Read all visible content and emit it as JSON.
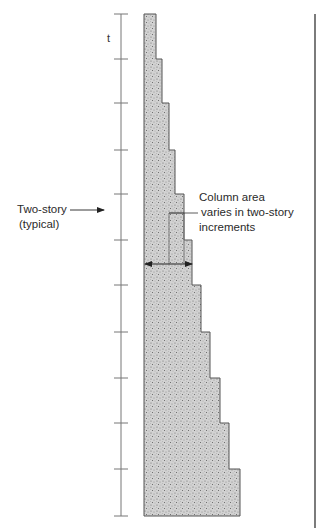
{
  "diagram": {
    "axis": {
      "label": "t",
      "x": 121,
      "y_top": 14,
      "y_bottom": 516,
      "tick_half_width": 7,
      "ticks_y": [
        14,
        59,
        103,
        150,
        194,
        240,
        285,
        332,
        378,
        423,
        469,
        516
      ]
    },
    "column": {
      "left_x": 144,
      "steps": [
        {
          "y_top": 14,
          "y_bottom": 59,
          "right_x": 156
        },
        {
          "y_top": 59,
          "y_bottom": 103,
          "right_x": 162
        },
        {
          "y_top": 103,
          "y_bottom": 150,
          "right_x": 169
        },
        {
          "y_top": 150,
          "y_bottom": 194,
          "right_x": 175
        },
        {
          "y_top": 194,
          "y_bottom": 240,
          "right_x": 184
        },
        {
          "y_top": 240,
          "y_bottom": 285,
          "right_x": 192
        },
        {
          "y_top": 285,
          "y_bottom": 332,
          "right_x": 201
        },
        {
          "y_top": 332,
          "y_bottom": 378,
          "right_x": 210
        },
        {
          "y_top": 378,
          "y_bottom": 423,
          "right_x": 220
        },
        {
          "y_top": 423,
          "y_bottom": 469,
          "right_x": 229
        },
        {
          "y_top": 469,
          "y_bottom": 516,
          "right_x": 240
        }
      ],
      "fill_color": "#c9c9c9",
      "stroke_color": "#555555"
    },
    "inner_highlight": {
      "x_left": 169,
      "x_right": 184,
      "y_top": 213,
      "y_bottom": 264
    },
    "dimension_arrow": {
      "y": 264,
      "x_start": 145,
      "x_end": 192
    },
    "annotations": {
      "two_story": {
        "line1": "Two-story",
        "line2": "(typical)",
        "arrow_from_x": 70,
        "arrow_to_x": 104,
        "arrow_y": 210
      },
      "column_area": {
        "line1": "Column area",
        "line2": "varies in two-story",
        "line3": "increments",
        "leader_from_x": 169,
        "leader_to_x": 198,
        "leader_y": 213
      }
    },
    "frame_line_x": 315
  }
}
